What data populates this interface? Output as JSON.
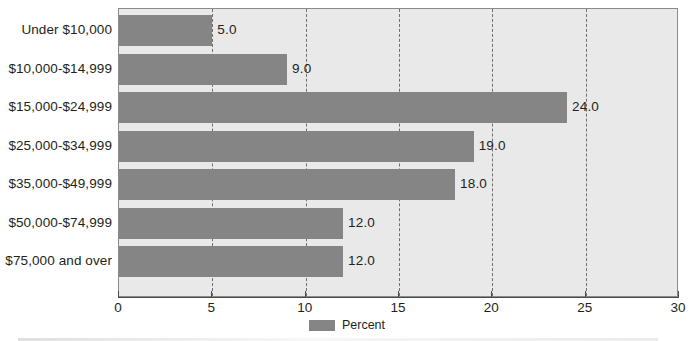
{
  "chart_data": {
    "type": "bar",
    "orientation": "horizontal",
    "title": "",
    "xlabel": "",
    "ylabel": "",
    "categories": [
      "Under $10,000",
      "$10,000-$14,999",
      "$15,000-$24,999",
      "$25,000-$34,999",
      "$35,000-$49,999",
      "$50,000-$74,999",
      "$75,000 and over"
    ],
    "values": [
      5.0,
      9.0,
      24.0,
      19.0,
      18.0,
      12.0,
      12.0
    ],
    "value_labels": [
      "5.0",
      "9.0",
      "24.0",
      "19.0",
      "18.0",
      "12.0",
      "12.0"
    ],
    "series": [
      {
        "name": "Percent",
        "values": [
          5.0,
          9.0,
          24.0,
          19.0,
          18.0,
          12.0,
          12.0
        ],
        "color": "#858585"
      }
    ],
    "xlim": [
      0,
      30
    ],
    "xticks": [
      0,
      5,
      10,
      15,
      20,
      25,
      30
    ],
    "xtick_labels": [
      "0",
      "5",
      "10",
      "15",
      "20",
      "25",
      "30"
    ],
    "gridlines": [
      5,
      10,
      15,
      20,
      25
    ],
    "grid": true,
    "grid_style": "dashed",
    "legend": {
      "position": "bottom-center",
      "entries": [
        {
          "label": "Percent",
          "color": "#858585"
        }
      ]
    },
    "colors": {
      "bar": "#858585",
      "plot_background": "#e9e9e9",
      "page_background": "#ffffff",
      "text": "#231f20",
      "axis": "#4a4a4a",
      "gridline": "#6f6f6f",
      "plot_border": "#8b8b8b"
    }
  }
}
